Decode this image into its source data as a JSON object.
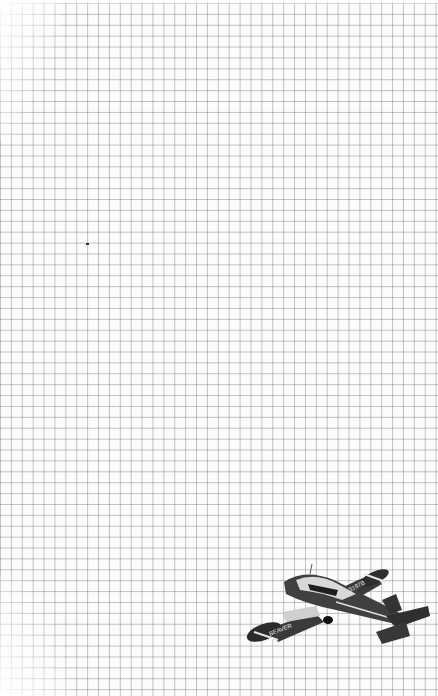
{
  "background": {
    "type": "grid-paper",
    "grid_color": "#8a8a8a",
    "paper_color": "#fcfcfc"
  },
  "decoration": {
    "icon": "airplane-icon",
    "wing_text_left": "BEAVER",
    "wing_text_right": "3197B"
  }
}
